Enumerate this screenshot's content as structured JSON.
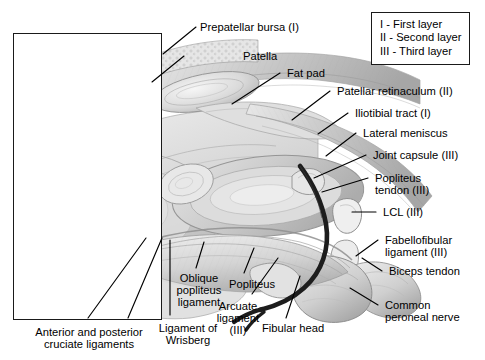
{
  "figure": {
    "background_color": "#ffffff",
    "line_color": "#000000",
    "art_tone_light": "#e9e9e9",
    "art_tone_mid": "#c9c9c9",
    "art_tone_dark": "#9a9a9a",
    "nerve_color": "#1d1d1d"
  },
  "legend": {
    "lines": [
      "I - First layer",
      "II - Second layer",
      "III - Third layer"
    ]
  },
  "labels": {
    "prepatellar_bursa": "Prepatellar bursa (I)",
    "patella": "Patella",
    "fat_pad": "Fat pad",
    "patellar_retinaculum": "Patellar retinaculum (II)",
    "iliotibial_tract": "Iliotibial tract (I)",
    "lateral_meniscus": "Lateral meniscus",
    "joint_capsule": "Joint capsule (III)",
    "popliteus_tendon_l1": "Popliteus",
    "popliteus_tendon_l2": "tendon (III)",
    "lcl": "LCL (III)",
    "fabellofibular_l1": "Fabellofibular",
    "fabellofibular_l2": "ligament (III)",
    "biceps_tendon": "Biceps tendon",
    "common_peroneal_l1": "Common",
    "common_peroneal_l2": "peroneal nerve",
    "fibular_head": "Fibular head",
    "arcuate_l1": "Arcuate",
    "arcuate_l2": "ligament",
    "arcuate_l3": "(III)",
    "popliteus": "Popliteus",
    "oblique_popliteus_l1": "Oblique",
    "oblique_popliteus_l2": "popliteus",
    "oblique_popliteus_l3": "ligament",
    "wrisberg_l1": "Ligament of",
    "wrisberg_l2": "Wrisberg",
    "cruciate_l1": "Anterior and posterior",
    "cruciate_l2": "cruciate ligaments"
  }
}
